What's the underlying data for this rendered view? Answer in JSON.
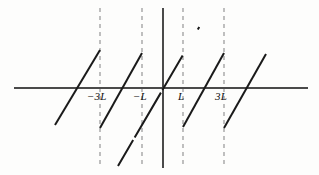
{
  "figure": {
    "background_color": "#fdfdfc",
    "axis_color": "#4a4a4a",
    "curve_color": "#1a1a1a",
    "dashed_color": "#8c8c8c",
    "label_color": "#111111"
  },
  "axes": {
    "x_axis": {
      "name": "horizontal-axis",
      "y_pixel": 88,
      "x_start": 14,
      "x_end": 308,
      "stroke_width": 2.0
    },
    "y_axis": {
      "name": "vertical-axis",
      "x_pixel": 163,
      "y_start": 8,
      "y_end": 168,
      "stroke_width": 2.0
    }
  },
  "tick_labels": [
    {
      "text": "−3L",
      "x": 87,
      "y": 90,
      "name": "tick-label-minus-3L"
    },
    {
      "text": "−L",
      "x": 133,
      "y": 90,
      "name": "tick-label-minus-L"
    },
    {
      "text": "L",
      "x": 178,
      "y": 90,
      "name": "tick-label-L"
    },
    {
      "text": "3L",
      "x": 215,
      "y": 90,
      "name": "tick-label-3L"
    }
  ],
  "dashed_verticals": [
    {
      "name": "dashed-line-minus-3L",
      "x": 100,
      "y_start": 8,
      "y_end": 168
    },
    {
      "name": "dashed-line-minus-L",
      "x": 142,
      "y_start": 8,
      "y_end": 168
    },
    {
      "name": "dashed-line-L",
      "x": 183,
      "y_start": 8,
      "y_end": 168
    },
    {
      "name": "dashed-line-3L",
      "x": 224,
      "y_start": 8,
      "y_end": 168
    }
  ],
  "chart_data": {
    "type": "line",
    "xlabel": "",
    "ylabel": "",
    "xlim": [
      -4.6,
      4.6
    ],
    "ylim": [
      -2.0,
      2.0
    ],
    "grid": false,
    "legend": null,
    "period": "2L",
    "x_tick_values": [
      -3,
      -1,
      1,
      3
    ],
    "x_tick_labels": [
      "−3L",
      "−L",
      "L",
      "3L"
    ],
    "series": [
      {
        "name": "branch-1",
        "style": "solid",
        "points_px": [
          [
            55,
            125
          ],
          [
            100,
            50
          ]
        ]
      },
      {
        "name": "branch-2",
        "style": "solid",
        "points_px": [
          [
            100,
            128
          ],
          [
            142,
            53
          ]
        ]
      },
      {
        "name": "branch-3-center",
        "style": "solid-with-breaks",
        "points_px": [
          [
            118,
            166
          ],
          [
            163,
            88
          ],
          [
            211,
            7
          ]
        ]
      },
      {
        "name": "branch-4",
        "style": "solid",
        "points_px": [
          [
            183,
            127
          ],
          [
            224,
            53
          ]
        ]
      },
      {
        "name": "branch-5",
        "style": "solid",
        "points_px": [
          [
            224,
            128
          ],
          [
            266,
            54
          ]
        ]
      }
    ]
  }
}
